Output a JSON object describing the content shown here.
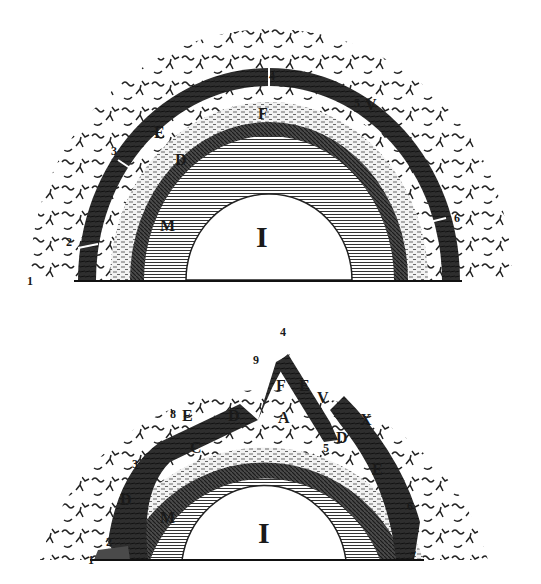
{
  "figures": [
    {
      "id": "top",
      "description": "Earth cross-section, undisturbed concentric strata",
      "labels": {
        "core": "I",
        "M": "M",
        "D": "D",
        "E": "E",
        "F": "F",
        "C": "C",
        "V": "V",
        "n1": "1",
        "n2": "2",
        "n3": "3",
        "n4": "4",
        "n5": "5",
        "n6": "6"
      }
    },
    {
      "id": "bottom",
      "description": "Earth cross-section, collapsed/broken strata",
      "labels": {
        "core": "I",
        "M": "M",
        "A": "A",
        "C": "C",
        "D1": "D",
        "D2": "D",
        "D3": "D",
        "E1": "E",
        "E2": "E",
        "E3": "E",
        "F": "F",
        "V": "V",
        "X": "X",
        "n1": "1",
        "n2": "2",
        "n3": "3",
        "n4": "4",
        "n5": "5",
        "n6": "6",
        "n7": "7",
        "n8": "8",
        "n9": "9"
      }
    }
  ],
  "colors": {
    "ink": "#1a1a1a",
    "paper": "#ffffff",
    "dark_band": "#3a3a3a",
    "mid_band": "#8a8a8a",
    "light_band": "#cfcfcf"
  }
}
